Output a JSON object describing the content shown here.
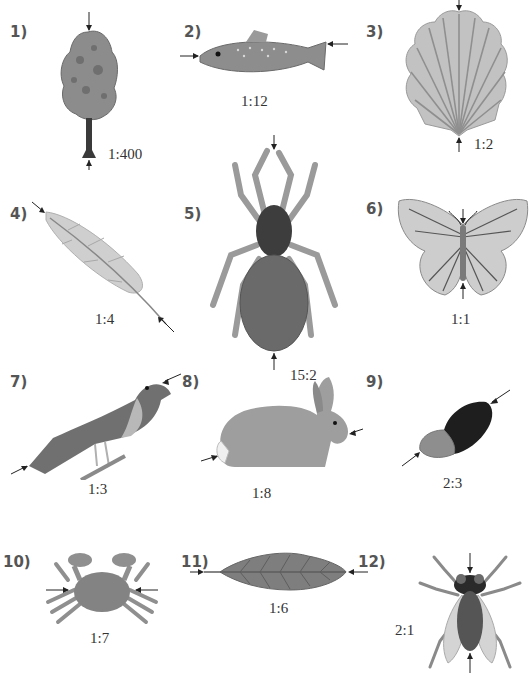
{
  "worksheet": {
    "items": [
      {
        "number": "1)",
        "subject": "tree",
        "scale": "1:400"
      },
      {
        "number": "2)",
        "subject": "fish",
        "scale": "1:12"
      },
      {
        "number": "3)",
        "subject": "scallop shell",
        "scale": "1:2"
      },
      {
        "number": "4)",
        "subject": "feather",
        "scale": "1:4"
      },
      {
        "number": "5)",
        "subject": "spider",
        "scale": "15:2"
      },
      {
        "number": "6)",
        "subject": "butterfly",
        "scale": "1:1"
      },
      {
        "number": "7)",
        "subject": "bird",
        "scale": "1:3"
      },
      {
        "number": "8)",
        "subject": "rabbit",
        "scale": "1:8"
      },
      {
        "number": "9)",
        "subject": "acorn",
        "scale": "2:3"
      },
      {
        "number": "10)",
        "subject": "crab",
        "scale": "1:7"
      },
      {
        "number": "11)",
        "subject": "leaf",
        "scale": "1:6"
      },
      {
        "number": "12)",
        "subject": "fly",
        "scale": "2:1"
      }
    ]
  },
  "colors": {
    "figure_fill": "#8f8f8f",
    "figure_dark": "#3a3a3a",
    "figure_light": "#c4c4c4",
    "arrow": "#222222"
  }
}
